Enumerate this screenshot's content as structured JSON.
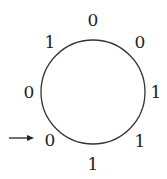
{
  "diagram": {
    "type": "binary-necklace",
    "circle": {
      "cx": 93,
      "cy": 92,
      "r": 52,
      "stroke": "#333333"
    },
    "digits": [
      {
        "label": "0",
        "x": 93,
        "y": 20
      },
      {
        "label": "0",
        "x": 140,
        "y": 42
      },
      {
        "label": "1",
        "x": 156,
        "y": 92
      },
      {
        "label": "1",
        "x": 140,
        "y": 141
      },
      {
        "label": "1",
        "x": 93,
        "y": 164
      },
      {
        "label": "0",
        "x": 50,
        "y": 140
      },
      {
        "label": "0",
        "x": 29,
        "y": 92
      },
      {
        "label": "1",
        "x": 50,
        "y": 42
      }
    ],
    "arrow": {
      "x1": 9,
      "y1": 138,
      "x2": 34,
      "y2": 138,
      "points_to": "0"
    },
    "sequence": "00111001"
  }
}
